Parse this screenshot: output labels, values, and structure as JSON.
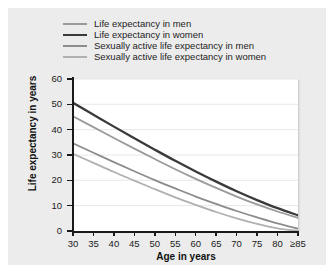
{
  "chart_data": {
    "type": "line",
    "title": "",
    "xlabel": "Age in years",
    "ylabel": "Life expectancy in years",
    "xlim": [
      30,
      85
    ],
    "ylim": [
      0,
      60
    ],
    "grid": true,
    "legend_position": "above-plot",
    "x": [
      30,
      35,
      40,
      45,
      50,
      55,
      60,
      65,
      70,
      75,
      80,
      85
    ],
    "x_tick_labels": [
      "30",
      "35",
      "40",
      "45",
      "50",
      "55",
      "60",
      "65",
      "70",
      "75",
      "80",
      "≥85"
    ],
    "y_tick_labels": [
      "0",
      "10",
      "20",
      "30",
      "40",
      "50",
      "60"
    ],
    "y_ticks": [
      0,
      10,
      20,
      30,
      40,
      50,
      60
    ],
    "series": [
      {
        "name": "Life expectancy in men",
        "color": "#9a9a9a",
        "width": 1.8,
        "values": [
          45.3,
          41.0,
          36.7,
          32.5,
          28.4,
          24.4,
          20.6,
          17.0,
          13.6,
          10.5,
          7.7,
          5.2
        ]
      },
      {
        "name": "Life expectancy in women",
        "color": "#3a3a3a",
        "width": 2.3,
        "values": [
          50.6,
          45.9,
          41.2,
          36.6,
          32.1,
          27.7,
          23.5,
          19.5,
          15.7,
          12.2,
          9.0,
          6.2
        ]
      },
      {
        "name": "Sexually active life expectancy in men",
        "color": "#8c8c8c",
        "width": 1.8,
        "values": [
          34.6,
          30.9,
          27.2,
          23.6,
          20.1,
          16.8,
          13.6,
          10.7,
          7.9,
          5.4,
          3.0,
          0.9
        ]
      },
      {
        "name": "Sexually active life expectancy in women",
        "color": "#b0b0b0",
        "width": 1.8,
        "values": [
          30.5,
          26.9,
          23.3,
          19.9,
          16.5,
          13.3,
          10.3,
          7.5,
          5.0,
          2.8,
          1.0,
          0.1
        ]
      }
    ]
  },
  "legend": {
    "items": [
      {
        "label": "Life expectancy in men",
        "color": "#9a9a9a",
        "thickness": "2px"
      },
      {
        "label": "Life expectancy in women",
        "color": "#3a3a3a",
        "thickness": "2.6px"
      },
      {
        "label": "Sexually active life expectancy in men",
        "color": "#8c8c8c",
        "thickness": "2px"
      },
      {
        "label": "Sexually active life expectancy in women",
        "color": "#b0b0b0",
        "thickness": "2px"
      }
    ]
  },
  "colors": {
    "page_background": "#ffffff",
    "figure_background": "#ececec",
    "plot_background": "#ffffff",
    "grid": "#e8e8e8",
    "axis": "#1a1a1a",
    "text": "#1a1a1a"
  }
}
